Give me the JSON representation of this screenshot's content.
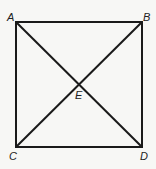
{
  "diagram": {
    "type": "geometry",
    "shape": "square",
    "stroke_color": "#1a1a1a",
    "background": "#f7f7f5",
    "vertices": [
      {
        "id": "A",
        "label": "A",
        "x": 16,
        "y": 22,
        "label_x": 7,
        "label_y": 12
      },
      {
        "id": "B",
        "label": "B",
        "x": 142,
        "y": 22,
        "label_x": 143,
        "label_y": 12
      },
      {
        "id": "C",
        "label": "C",
        "x": 16,
        "y": 147,
        "label_x": 9,
        "label_y": 151
      },
      {
        "id": "D",
        "label": "D",
        "x": 142,
        "y": 147,
        "label_x": 140,
        "label_y": 151
      }
    ],
    "intersection": {
      "id": "E",
      "label": "E",
      "x": 79,
      "y": 84,
      "label_x": 75,
      "label_y": 90
    },
    "segments": [
      {
        "from": "A",
        "to": "B"
      },
      {
        "from": "B",
        "to": "D"
      },
      {
        "from": "D",
        "to": "C"
      },
      {
        "from": "C",
        "to": "A"
      },
      {
        "from": "A",
        "to": "D"
      },
      {
        "from": "B",
        "to": "C"
      }
    ]
  }
}
